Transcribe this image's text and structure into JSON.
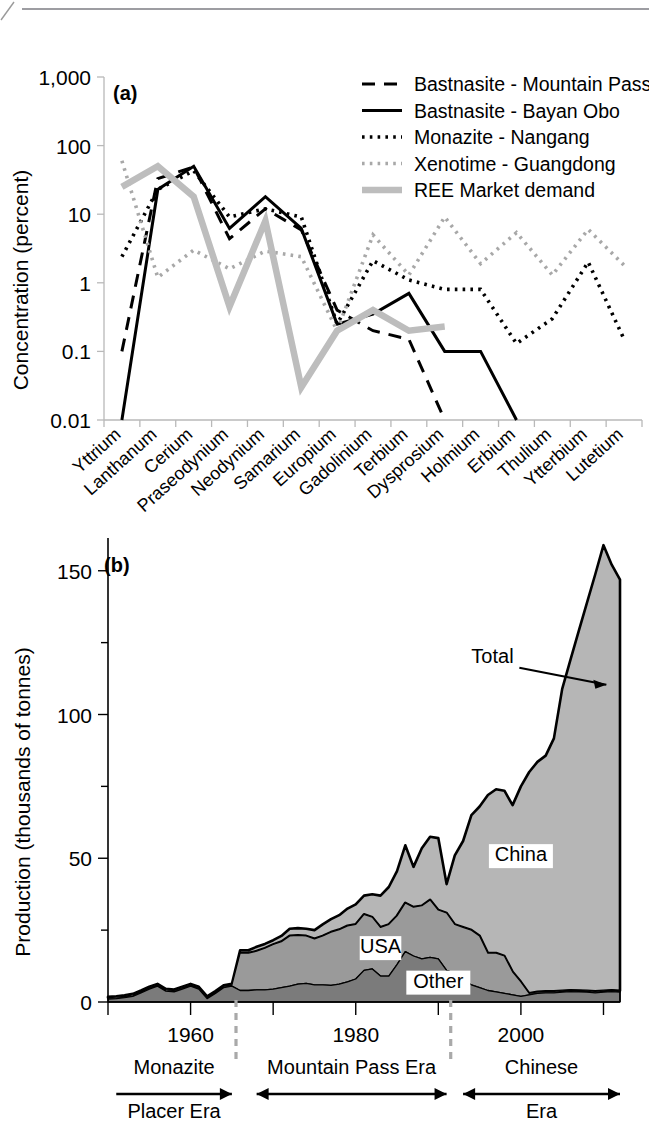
{
  "figure": {
    "panel_a_id": "(a)",
    "panel_b_id": "(b)"
  },
  "chart_data": [
    {
      "type": "line",
      "panel": "(a)",
      "title": "",
      "xlabel": "",
      "ylabel": "Concentration (percent)",
      "yscale": "log",
      "ylim": [
        0.01,
        1000
      ],
      "ytick_labels": [
        "0.01",
        "0.1",
        "1",
        "10",
        "100",
        "1,000"
      ],
      "ytick_values": [
        0.01,
        0.1,
        1,
        10,
        100,
        1000
      ],
      "grid": false,
      "legend_position": "top-right",
      "categories": [
        "Yttrium",
        "Lanthanum",
        "Cerium",
        "Praseodynium",
        "Neodynium",
        "Samarium",
        "Europium",
        "Gadolinium",
        "Terbium",
        "Dysprosium",
        "Holmium",
        "Erbium",
        "Thulium",
        "Ytterbium",
        "Lutetium"
      ],
      "series": [
        {
          "name": "Bastnasite - Mountain Pass",
          "style": "dashed",
          "color": "#000000",
          "values": [
            0.1,
            33,
            49,
            4.4,
            12,
            5.9,
            0.4,
            0.2,
            0.15,
            0.01,
            null,
            null,
            null,
            null,
            null
          ]
        },
        {
          "name": "Bastnasite - Bayan Obo",
          "style": "solid",
          "color": "#000000",
          "values": [
            0.01,
            23,
            50,
            6.2,
            18,
            6.2,
            0.25,
            0.35,
            0.7,
            0.1,
            0.1,
            0.01,
            null,
            null,
            null
          ]
        },
        {
          "name": "Monazite - Nangang",
          "style": "dotted",
          "color": "#000000",
          "values": [
            2.4,
            23,
            43,
            9.1,
            12,
            9.1,
            0.25,
            2.1,
            1.1,
            0.8,
            0.8,
            0.13,
            0.3,
            2.0,
            0.15
          ]
        },
        {
          "name": "Xenotime - Guangdong",
          "style": "dotted",
          "color": "#a8a8a8",
          "values": [
            60,
            1.2,
            3.0,
            1.6,
            2.9,
            2.4,
            0.2,
            5.0,
            1.3,
            9.1,
            1.9,
            5.4,
            1.3,
            6.0,
            1.8
          ]
        },
        {
          "name": "REE Market demand",
          "style": "thick-solid",
          "color": "#bdbdbd",
          "values": [
            25,
            50,
            18,
            0.45,
            8.0,
            0.03,
            0.2,
            0.4,
            0.2,
            0.23,
            null,
            null,
            null,
            null,
            null
          ]
        }
      ]
    },
    {
      "type": "area",
      "panel": "(b)",
      "title": "",
      "xlabel": "",
      "ylabel": "Production (thousands of tonnes)",
      "stacked": true,
      "xlim": [
        1950,
        2012
      ],
      "ylim": [
        0,
        160
      ],
      "xtick_labels": [
        "1960",
        "1980",
        "2000"
      ],
      "xtick_values": [
        1960,
        1980,
        2000
      ],
      "xticks_all": [
        1950,
        1960,
        1970,
        1980,
        1990,
        2000,
        2010
      ],
      "ytick_labels": [
        "0",
        "50",
        "100",
        "150"
      ],
      "ytick_values": [
        0,
        50,
        100,
        150
      ],
      "yticks_minor": [
        25,
        75,
        125
      ],
      "grid": false,
      "x": [
        1950,
        1951,
        1952,
        1953,
        1954,
        1955,
        1956,
        1957,
        1958,
        1959,
        1960,
        1961,
        1962,
        1963,
        1964,
        1965,
        1966,
        1967,
        1968,
        1969,
        1970,
        1971,
        1972,
        1973,
        1974,
        1975,
        1976,
        1977,
        1978,
        1979,
        1980,
        1981,
        1982,
        1983,
        1984,
        1985,
        1986,
        1987,
        1988,
        1989,
        1990,
        1991,
        1992,
        1993,
        1994,
        1995,
        1996,
        1997,
        1998,
        1999,
        2000,
        2001,
        2002,
        2003,
        2004,
        2005,
        2006,
        2007,
        2008,
        2009,
        2010,
        2011,
        2012
      ],
      "series": [
        {
          "name": "Other",
          "color": "#7b7b7b",
          "values": [
            1.0,
            1.2,
            1.5,
            2.0,
            3.2,
            4.5,
            5.5,
            3.8,
            3.5,
            4.5,
            5.5,
            4.5,
            1.2,
            3.0,
            5.0,
            5.5,
            4.0,
            4.0,
            4.2,
            4.2,
            4.5,
            5.0,
            5.5,
            6.2,
            6.5,
            6.0,
            6.0,
            5.8,
            6.2,
            7.0,
            8.0,
            11.0,
            11.5,
            9.0,
            9.0,
            13.0,
            17.5,
            16.0,
            15.0,
            15.5,
            15.0,
            11.0,
            10.0,
            7.5,
            6.0,
            5.0,
            4.0,
            3.5,
            3.0,
            2.5,
            2.0,
            2.5,
            3.0,
            3.2,
            3.2,
            3.4,
            3.6,
            3.5,
            3.4,
            3.2,
            3.4,
            3.6,
            3.4
          ]
        },
        {
          "name": "USA",
          "color": "#9a9a9a",
          "values": [
            0.5,
            0.5,
            0.5,
            0.5,
            0.5,
            0.5,
            0.5,
            0.5,
            0.5,
            0.5,
            0.5,
            0.5,
            0.5,
            0.5,
            0.5,
            0.5,
            13.0,
            13.0,
            13.5,
            14.5,
            15.5,
            16.0,
            17.5,
            17.0,
            16.5,
            16.0,
            17.0,
            18.5,
            19.0,
            19.5,
            19.0,
            19.5,
            18.0,
            17.0,
            18.0,
            17.0,
            17.0,
            17.0,
            18.5,
            20.0,
            17.0,
            20.0,
            17.0,
            18.5,
            19.0,
            18.0,
            13.0,
            13.5,
            13.0,
            8.0,
            5.0,
            0.5,
            0.5,
            0.5,
            0.5,
            0.5,
            0.5,
            0.5,
            0.5,
            0.5,
            0.5,
            0.5,
            0.5
          ]
        },
        {
          "name": "China",
          "color": "#b6b6b6",
          "values": [
            0.3,
            0.3,
            0.3,
            0.3,
            0.3,
            0.3,
            0.3,
            0.3,
            0.3,
            0.3,
            0.3,
            0.3,
            0.3,
            0.3,
            0.3,
            0.3,
            1.0,
            1.0,
            1.5,
            1.5,
            1.5,
            2.0,
            2.5,
            2.5,
            2.5,
            3.0,
            4.0,
            4.5,
            5.0,
            6.0,
            7.0,
            6.5,
            8.0,
            11.0,
            13.0,
            15.5,
            20.0,
            14.0,
            20.0,
            22.0,
            25.0,
            10.0,
            24.0,
            30.0,
            40.0,
            45.0,
            55.0,
            57.0,
            57.5,
            58.0,
            68.0,
            77.0,
            80.0,
            82.0,
            88.0,
            105.0,
            115.0,
            125.0,
            135.0,
            145.0,
            155.0,
            148.0,
            143.0
          ]
        }
      ],
      "area_labels": [
        {
          "text": "Total",
          "x": 1994,
          "y": 118
        },
        {
          "text": "China",
          "x": 2000,
          "y": 49
        },
        {
          "text": "USA",
          "x": 1983,
          "y": 17
        },
        {
          "text": "Other",
          "x": 1990,
          "y": 5
        }
      ],
      "annotations": {
        "eras": [
          {
            "label_top": "Monazite",
            "label_bottom": "Placer Era",
            "arrow": "right",
            "from": 1951,
            "to": 1965
          },
          {
            "label_top": "Mountain Pass Era",
            "label_bottom": "",
            "arrow": "both",
            "from": 1968,
            "to": 1991
          },
          {
            "label_top": "Chinese",
            "label_bottom": "Era",
            "arrow": "both",
            "from": 1993,
            "to": 2012
          }
        ],
        "separators": [
          1965.5,
          1991.5
        ]
      }
    }
  ]
}
